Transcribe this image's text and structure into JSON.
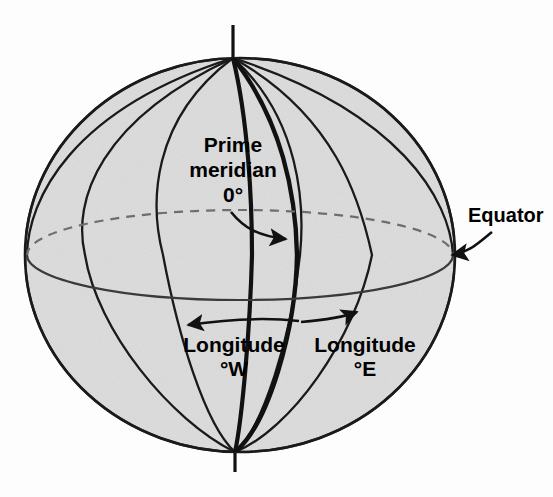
{
  "figure": {
    "type": "diagram",
    "background_color": "#fdfdfd",
    "sphere_fill": "#dcdcdc",
    "line_color": "#1a1a1a"
  },
  "labels": {
    "prime_meridian_line1": "Prime",
    "prime_meridian_line2": "meridian",
    "prime_meridian_line3": "0°",
    "equator": "Equator",
    "longitude_west_line1": "Longitude",
    "longitude_west_line2": "°W",
    "longitude_east_line1": "Longitude",
    "longitude_east_line2": "°E"
  },
  "icons": {
    "prime_meridian_pointer": "curved-arrow-icon",
    "equator_pointer": "curved-arrow-icon",
    "west_arrow": "arrow-left-icon",
    "east_arrow": "arrow-right-icon",
    "polar_axis": "axis-line-icon"
  },
  "geometry": {
    "sphere_center_x": 240,
    "sphere_center_y": 255,
    "sphere_radius_x": 215,
    "sphere_radius_y": 197,
    "north_pole_y": 58,
    "south_pole_y": 452,
    "axis_top_y": 25,
    "axis_bottom_y": 472,
    "equator_ellipse_ry": 45,
    "meridian_count": 7,
    "prime_meridian_offset": 57
  }
}
